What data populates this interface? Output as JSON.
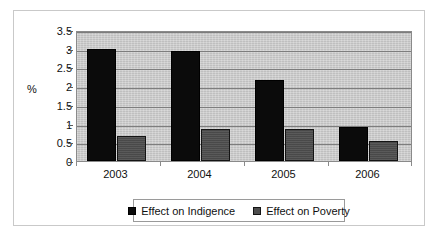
{
  "chart_data": {
    "type": "bar",
    "title": "",
    "xlabel": "",
    "ylabel": "%",
    "categories": [
      "2003",
      "2004",
      "2005",
      "2006"
    ],
    "series": [
      {
        "name": "Effect on Indigence",
        "color": "#0b0b0b",
        "values": [
          3.0,
          2.95,
          2.17,
          0.9
        ]
      },
      {
        "name": "Effect on Poverty",
        "color": "#4d4d4d",
        "values": [
          0.68,
          0.85,
          0.85,
          0.54
        ]
      }
    ],
    "ylim": [
      0,
      3.5
    ],
    "yticks": [
      "0",
      "0.5",
      "1",
      "1.5",
      "2",
      "2.5",
      "3",
      "3.5"
    ],
    "ytick_values": [
      0,
      0.5,
      1,
      1.5,
      2,
      2.5,
      3,
      3.5
    ],
    "grid": true,
    "legend_position": "bottom",
    "plot_background": "#c9c9c9",
    "gridline_color": "#7d7d7d"
  }
}
